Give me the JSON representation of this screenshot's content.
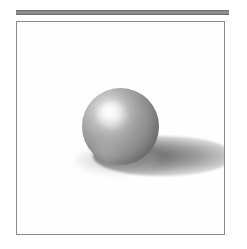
{
  "page": {
    "background_color": "#ffffff",
    "width": 247,
    "height": 249
  },
  "top_rule": {
    "name": "horizontal-rule",
    "color": "#8b8b8b",
    "edge_color": "#6e6e6e",
    "thickness_px": 5,
    "width_px": 213
  },
  "frame": {
    "name": "image-frame",
    "border_color": "#8a8a8a",
    "border_width_px": 1,
    "fill_color": "#ffffff",
    "width_px": 209,
    "height_px": 214
  },
  "scene": {
    "description": "Gray shaded sphere resting on a white ground plane with a cast shadow extending to the right",
    "background_color": "#fefefe",
    "sphere": {
      "name": "shaded-sphere",
      "base_color": "#949494",
      "shadow_color": "#6a6a6a",
      "highlight_color": "#ffffff",
      "diameter_px": 77,
      "center_x_px": 103,
      "center_y_px": 104,
      "highlight_x_pct": 34,
      "highlight_y_pct": 30
    },
    "cast_shadow": {
      "name": "cast-shadow",
      "color": "#686868",
      "falloff_color": "#c8c8c8",
      "width_px": 140,
      "height_px": 40,
      "direction": "right"
    },
    "contact_shadow": {
      "name": "contact-shadow",
      "color": "#969696",
      "width_px": 86,
      "height_px": 26
    },
    "light": {
      "name": "key-light",
      "direction": "upper-left",
      "type": "point"
    }
  },
  "caption": {
    "text": ""
  }
}
